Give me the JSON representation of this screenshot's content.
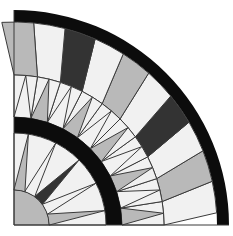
{
  "figure": {
    "center": [
      14,
      225
    ],
    "colors": {
      "black": "#0c0c0c",
      "dark": "#333333",
      "gray": "#b9b9b9",
      "light": "#f1f1f1",
      "line": "#3a3a3a",
      "background": "#ffffff"
    },
    "radii": {
      "core": 35,
      "inner_ring_inner": 92,
      "inner_ring_outer": 108,
      "triangle_band_outer": 150,
      "outer_band_inner": 203,
      "outer_band_outer": 215
    },
    "ray_band_colors": [
      "light",
      "gray",
      "light",
      "dark",
      "light",
      "gray",
      "light",
      "dark",
      "light",
      "gray"
    ],
    "triangle_band_colors": [
      "gray",
      "light",
      "gray",
      "light",
      "gray",
      "light",
      "gray",
      "light",
      "gray",
      "light"
    ],
    "star_colors": [
      "gray",
      "light",
      "dark",
      "light",
      "gray"
    ]
  }
}
